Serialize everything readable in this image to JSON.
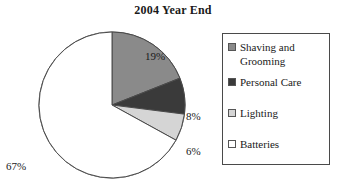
{
  "chart_data": {
    "type": "pie",
    "title": "2004 Year End",
    "categories": [
      "Shaving and Grooming",
      "Personal Care",
      "Lighting",
      "Batteries"
    ],
    "values": [
      19,
      8,
      6,
      67
    ],
    "value_labels": [
      "19%",
      "8%",
      "6%",
      "67%"
    ],
    "units": "percent",
    "start_angle_deg": 0,
    "direction": "clockwise",
    "legend_position": "right",
    "legend_border": true,
    "grid": false,
    "slice_colors": [
      "#8a8a8a",
      "#3a3a3a",
      "#d5d5d5",
      "#ffffff"
    ],
    "slice_outline_color": "#4a4a4a",
    "background_color": "#ffffff",
    "text_color": "#1a1a1a"
  },
  "legend": {
    "items": [
      {
        "label": "Shaving and Grooming",
        "color": "#8a8a8a"
      },
      {
        "label": "Personal Care",
        "color": "#3a3a3a"
      },
      {
        "label": "Lighting",
        "color": "#d5d5d5"
      },
      {
        "label": "Batteries",
        "color": "#ffffff"
      }
    ]
  }
}
